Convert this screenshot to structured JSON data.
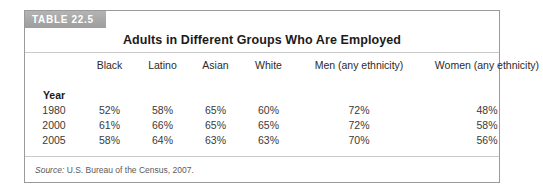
{
  "figure": {
    "banner_label": "TABLE 22.5",
    "title": "Adults in Different Groups Who Are Employed",
    "source_label": "Source:",
    "source_text": "U.S. Bureau of the Census, 2007.",
    "banner_color": "#a8a8a8",
    "border_color": "#9a9a9a",
    "rule_color": "#c9c9c9"
  },
  "chart_data": {
    "type": "table",
    "title": "Adults in Different Groups Who Are Employed",
    "row_group_label": "Year",
    "columns": [
      "Year",
      "Black",
      "Latino",
      "Asian",
      "White",
      "Men (any ethnicity)",
      "Women (any ethnicity)"
    ],
    "rows": [
      {
        "year": "1980",
        "black": "52%",
        "latino": "58%",
        "asian": "65%",
        "white": "60%",
        "men": "72%",
        "women": "48%"
      },
      {
        "year": "2000",
        "black": "61%",
        "latino": "66%",
        "asian": "65%",
        "white": "65%",
        "men": "72%",
        "women": "58%"
      },
      {
        "year": "2005",
        "black": "58%",
        "latino": "64%",
        "asian": "63%",
        "white": "63%",
        "men": "70%",
        "women": "56%"
      }
    ],
    "units": "percent",
    "source": "U.S. Bureau of the Census, 2007."
  }
}
